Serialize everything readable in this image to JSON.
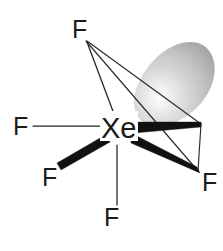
{
  "figure": {
    "background_color": "#ffffff",
    "center_atom": {
      "label": "Xe",
      "x": 118,
      "y": 128
    },
    "fluorine_atoms": [
      {
        "id": "f-top",
        "label": "F",
        "x": 80,
        "y": 30,
        "bond": "plain"
      },
      {
        "id": "f-left",
        "label": "F",
        "x": 20,
        "y": 126,
        "bond": "plain"
      },
      {
        "id": "f-bottom-left",
        "label": "F",
        "x": 49,
        "y": 177,
        "bond": "wedge"
      },
      {
        "id": "f-bottom",
        "label": "F",
        "x": 111,
        "y": 216,
        "bond": "plain"
      },
      {
        "id": "f-bottom-right",
        "label": "F",
        "x": 209,
        "y": 182,
        "bond": "wedge"
      }
    ],
    "lone_pair_lobe": {
      "id": "lone-pair-orbital",
      "center_x": 178,
      "center_y": 80,
      "fill_light": "#f2f2f2",
      "fill_mid": "#d0d0d0",
      "fill_dark": "#a6a6a6",
      "highlight": "#ffffff"
    },
    "bond_color": "#1b1b1b",
    "label_color": "#1b1b1b"
  }
}
